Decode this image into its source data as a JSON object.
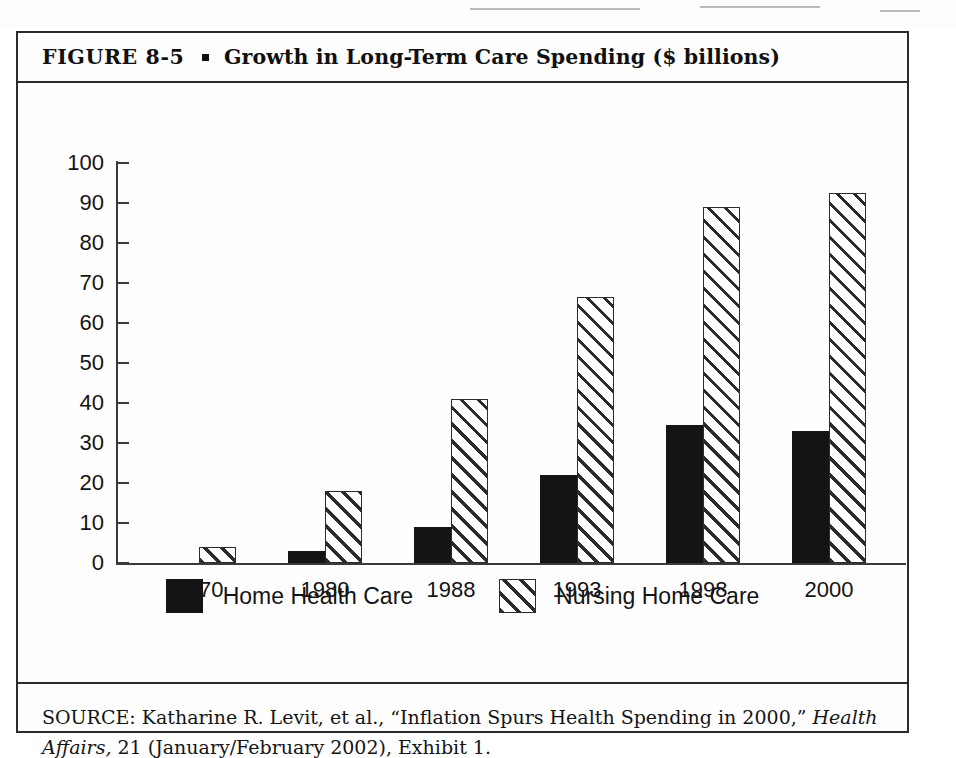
{
  "figure": {
    "number_label": "FIGURE  8-5",
    "bullet": "square-bullet",
    "title": "Growth in Long-Term Care Spending ($ billions)",
    "title_full": "FIGURE 8-5 ▪ Growth in Long-Term Care Spending ($ billions)"
  },
  "source": {
    "prefix": "SOURCE: Katharine R. Levit, et al., “Inflation Spurs Health Spending in 2000,” ",
    "journal": "Health Affairs,",
    "suffix": " 21 (January/February 2002), Exhibit 1."
  },
  "legend": {
    "items": [
      {
        "label": "Home Health Care",
        "swatch": "solid-black-swatch",
        "color": "#141414"
      },
      {
        "label": "Nursing Home Care",
        "swatch": "diagonal-hatch-swatch",
        "color": "#ffffff"
      }
    ]
  },
  "axes": {
    "y_ticks": [
      "100",
      "90",
      "80",
      "70",
      "60",
      "50",
      "40",
      "30",
      "20",
      "10",
      "0"
    ],
    "x_ticks": [
      "1970",
      "1980",
      "1988",
      "1993",
      "1998",
      "2000"
    ]
  },
  "chart_data": {
    "type": "bar",
    "title": "Growth in Long-Term Care Spending ($ billions)",
    "xlabel": "",
    "ylabel": "",
    "ylim": [
      0,
      100
    ],
    "ytick_interval": 10,
    "grid": false,
    "legend_position": "bottom-center",
    "units": "$ billions",
    "categories": [
      "1970",
      "1980",
      "1988",
      "1993",
      "1998",
      "2000"
    ],
    "series": [
      {
        "name": "Home Health Care",
        "style": "solid-black",
        "values": [
          null,
          3,
          9,
          22,
          34.5,
          33
        ]
      },
      {
        "name": "Nursing Home Care",
        "style": "diagonal-hatch",
        "values": [
          4,
          18,
          41,
          66.5,
          89,
          92.5
        ]
      }
    ]
  }
}
